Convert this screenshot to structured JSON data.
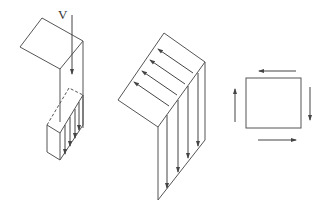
{
  "figures": [
    {
      "id": "shear-flow-plate-load",
      "label": "V",
      "description": "Bent plate with applied vertical load V; shear stress arrows on sectioned flange"
    },
    {
      "id": "shear-flow-bent-section",
      "description": "Bent plate showing shear flow along both legs"
    },
    {
      "id": "pure-shear-element",
      "description": "Square element with shear stress arrows on all four sides"
    }
  ],
  "colors": {
    "stroke": "#555555",
    "background": "#ffffff"
  }
}
